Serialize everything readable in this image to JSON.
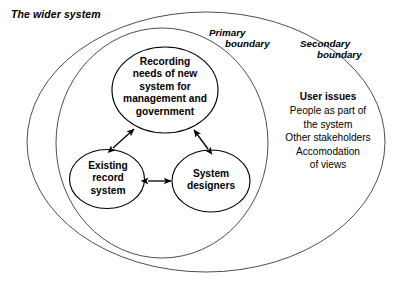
{
  "diagram": {
    "title_label": "The wider system",
    "boundaries": [
      {
        "id": "primary",
        "line1": "Primary",
        "line2": "boundary"
      },
      {
        "id": "secondary",
        "line1": "Secondary",
        "line2": "boundary"
      }
    ],
    "nodes": [
      {
        "id": "recording-needs",
        "lines": [
          "Recording",
          "needs of new",
          "system for",
          "management and",
          "government"
        ]
      },
      {
        "id": "existing-record-system",
        "lines": [
          "Existing",
          "record",
          "system"
        ]
      },
      {
        "id": "system-designers",
        "lines": [
          "System",
          "designers"
        ]
      }
    ],
    "user_issues": {
      "title": "User issues",
      "lines": [
        "People as part of",
        "the system",
        "Other stakeholders",
        "Accomodation",
        "of views"
      ]
    },
    "connections": [
      {
        "from": "existing-record-system",
        "to": "recording-needs",
        "type": "double-arrow"
      },
      {
        "from": "system-designers",
        "to": "recording-needs",
        "type": "double-arrow"
      },
      {
        "from": "existing-record-system",
        "to": "system-designers",
        "type": "double-arrow"
      }
    ],
    "colors": {
      "background": "#ffffff",
      "boundary_stroke": "#3a3a3a",
      "node_stroke": "#000000",
      "text": "#000000"
    }
  }
}
